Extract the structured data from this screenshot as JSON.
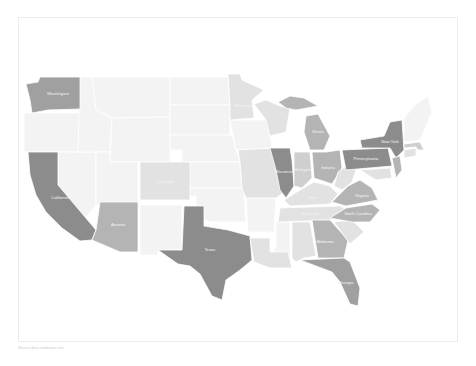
{
  "map": {
    "title": "",
    "type": "choropleth",
    "colors": {
      "darkest": "#8c8c8c",
      "dark": "#a0a0a0",
      "medium": "#b4b4b4",
      "light": "#cfcfcf",
      "lighter": "#e2e2e2",
      "faint": "#f3f3f3"
    },
    "states": [
      {
        "name": "Washington",
        "label": "Washington",
        "shade": "dark"
      },
      {
        "name": "Oregon",
        "label": "",
        "shade": "faint"
      },
      {
        "name": "California",
        "label": "California",
        "shade": "darkest"
      },
      {
        "name": "Nevada",
        "label": "",
        "shade": "faint"
      },
      {
        "name": "Idaho",
        "label": "",
        "shade": "faint"
      },
      {
        "name": "Montana",
        "label": "",
        "shade": "faint"
      },
      {
        "name": "Wyoming",
        "label": "",
        "shade": "faint"
      },
      {
        "name": "Utah",
        "label": "",
        "shade": "faint"
      },
      {
        "name": "Arizona",
        "label": "Arizona",
        "shade": "medium"
      },
      {
        "name": "Colorado",
        "label": "Colorado",
        "shade": "lighter"
      },
      {
        "name": "New Mexico",
        "label": "",
        "shade": "faint"
      },
      {
        "name": "North Dakota",
        "label": "",
        "shade": "faint"
      },
      {
        "name": "South Dakota",
        "label": "",
        "shade": "faint"
      },
      {
        "name": "Nebraska",
        "label": "",
        "shade": "faint"
      },
      {
        "name": "Kansas",
        "label": "",
        "shade": "faint"
      },
      {
        "name": "Oklahoma",
        "label": "",
        "shade": "faint"
      },
      {
        "name": "Texas",
        "label": "Texas",
        "shade": "darkest"
      },
      {
        "name": "Minnesota",
        "label": "Minnesota",
        "shade": "lighter"
      },
      {
        "name": "Iowa",
        "label": "",
        "shade": "faint"
      },
      {
        "name": "Missouri",
        "label": "",
        "shade": "lighter"
      },
      {
        "name": "Arkansas",
        "label": "",
        "shade": "faint"
      },
      {
        "name": "Louisiana",
        "label": "",
        "shade": "lighter"
      },
      {
        "name": "Wisconsin",
        "label": "Wisconsin",
        "shade": "lighter"
      },
      {
        "name": "Illinois",
        "label": "Illinois",
        "shade": "darkest"
      },
      {
        "name": "Michigan",
        "label": "Michigan",
        "shade": "medium"
      },
      {
        "name": "Indiana",
        "label": "Indiana",
        "shade": "light"
      },
      {
        "name": "Ohio",
        "label": "Ohio",
        "shade": "medium"
      },
      {
        "name": "Kentucky",
        "label": "Kentucky",
        "shade": "lighter"
      },
      {
        "name": "Tennessee",
        "label": "Tennessee",
        "shade": "lighter"
      },
      {
        "name": "Mississippi",
        "label": "",
        "shade": "faint"
      },
      {
        "name": "Alabama",
        "label": "Alabama",
        "shade": "lighter"
      },
      {
        "name": "Georgia",
        "label": "Georgia",
        "shade": "medium"
      },
      {
        "name": "Florida",
        "label": "Florida",
        "shade": "dark"
      },
      {
        "name": "South Carolina",
        "label": "",
        "shade": "lighter"
      },
      {
        "name": "North Carolina",
        "label": "North Carolina",
        "shade": "medium"
      },
      {
        "name": "Virginia",
        "label": "Virginia",
        "shade": "medium"
      },
      {
        "name": "West Virginia",
        "label": "",
        "shade": "lighter"
      },
      {
        "name": "Pennsylvania",
        "label": "Pennsylvania",
        "shade": "darkest"
      },
      {
        "name": "New York",
        "label": "New York",
        "shade": "darkest"
      },
      {
        "name": "New Jersey",
        "label": "",
        "shade": "medium"
      },
      {
        "name": "Maryland",
        "label": "",
        "shade": "lighter"
      },
      {
        "name": "Massachusetts",
        "label": "",
        "shade": "light"
      },
      {
        "name": "Connecticut",
        "label": "",
        "shade": "lighter"
      },
      {
        "name": "New England North",
        "label": "",
        "shade": "faint"
      }
    ],
    "footer": "Source data attribution text"
  }
}
